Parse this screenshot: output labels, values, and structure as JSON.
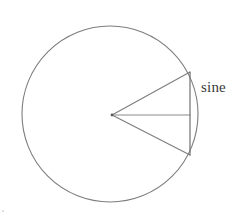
{
  "figure": {
    "background_color": "#ffffff",
    "stroke_color": "#7d7d7d",
    "text_color": "#3a3a3a",
    "labels": {
      "sine": "sine"
    },
    "geometry": {
      "circle": {
        "center_x": 110,
        "center_y": 114,
        "radius": 88
      },
      "center_point": {
        "x": 112,
        "y": 115
      },
      "upper_radius_end": {
        "x": 190,
        "y": 72
      },
      "lower_radius_end": {
        "x": 190,
        "y": 155
      },
      "chord_top": {
        "x": 190,
        "y": 72
      },
      "chord_bottom": {
        "x": 190,
        "y": 155
      },
      "horizontal_radius_end": {
        "x": 190,
        "y": 115
      }
    },
    "label_position": {
      "sine_x": 201,
      "sine_y": 92
    },
    "corner_mark": {
      "x": 3,
      "y": 211
    }
  },
  "chart_data": {
    "type": "diagram",
    "title": "sine",
    "elements": [
      {
        "name": "circle",
        "kind": "circle",
        "cx": 110,
        "cy": 114,
        "r": 88
      },
      {
        "name": "upper-radius",
        "kind": "line",
        "x1": 112,
        "y1": 115,
        "x2": 190,
        "y2": 72
      },
      {
        "name": "lower-radius",
        "kind": "line",
        "x1": 112,
        "y1": 115,
        "x2": 190,
        "y2": 155
      },
      {
        "name": "horizontal-radius",
        "kind": "line",
        "x1": 112,
        "y1": 115,
        "x2": 190,
        "y2": 115
      },
      {
        "name": "sine-chord",
        "kind": "line",
        "x1": 190,
        "y1": 72,
        "x2": 190,
        "y2": 155
      }
    ],
    "annotations": [
      {
        "text": "sine",
        "x": 201,
        "y": 92,
        "target": "sine-chord"
      }
    ],
    "xlabel": "",
    "ylabel": "",
    "legend": []
  }
}
